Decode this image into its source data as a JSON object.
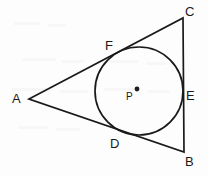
{
  "figure": {
    "background_color": "#fdfdfd",
    "stroke_color": "#1a1a1a",
    "label_color": "#1a1a1a"
  },
  "labels": {
    "vertex_a": "A",
    "vertex_b": "B",
    "vertex_c": "C",
    "tangent_d": "D",
    "tangent_e": "E",
    "tangent_f": "F",
    "center_p": "P"
  },
  "geometry": {
    "triangle": {
      "vertices": [
        {
          "name": "A",
          "x": 29,
          "y": 99
        },
        {
          "name": "C",
          "x": 183,
          "y": 18
        },
        {
          "name": "B",
          "x": 184,
          "y": 152
        }
      ],
      "sides": [
        "AC",
        "CB",
        "BA"
      ]
    },
    "incircle": {
      "center": {
        "name": "P",
        "x": 139,
        "y": 91
      },
      "radius": 44,
      "center_dot_radius": 2.4,
      "center_dot": {
        "x": 137,
        "y": 89
      }
    },
    "tangent_points": [
      {
        "name": "F",
        "side": "AC",
        "x": 112,
        "y": 56
      },
      {
        "name": "E",
        "side": "CB",
        "x": 183,
        "y": 91
      },
      {
        "name": "D",
        "side": "BA",
        "x": 122,
        "y": 134
      }
    ],
    "label_positions": {
      "A": {
        "x": 12,
        "y": 92
      },
      "B": {
        "x": 185,
        "y": 155
      },
      "C": {
        "x": 185,
        "y": 5
      },
      "D": {
        "x": 110,
        "y": 137
      },
      "E": {
        "x": 186,
        "y": 89
      },
      "F": {
        "x": 105,
        "y": 39
      },
      "P": {
        "x": 126,
        "y": 92
      }
    },
    "line_width": 1.7
  }
}
